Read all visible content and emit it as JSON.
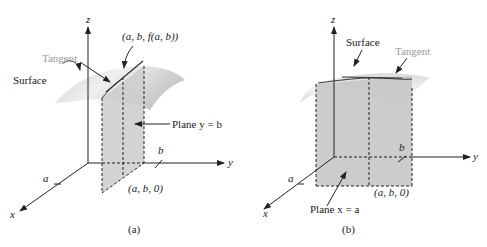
{
  "figure_a": {
    "caption": "(a)",
    "axis_z": "z",
    "axis_y": "y",
    "axis_x": "x",
    "label_point": "(a, b, f(a, b))",
    "label_tangent": "Tangent",
    "label_surface": "Surface",
    "label_plane": "Plane y = b",
    "label_b": "b",
    "label_a": "a",
    "label_base": "(a, b, 0)"
  },
  "figure_b": {
    "caption": "(b)",
    "axis_z": "z",
    "axis_y": "y",
    "axis_x": "x",
    "label_surface": "Surface",
    "label_tangent": "Tangent",
    "label_plane": "Plane x = a",
    "label_b": "b",
    "label_a": "a",
    "label_base": "(a, b, 0)"
  },
  "colors": {
    "surface_light": "#e6e6e6",
    "surface_dark": "#bdbdbd",
    "plane_fill": "#cfcfcf",
    "tangent_label": "#9a9a9a",
    "ink": "#222222"
  }
}
